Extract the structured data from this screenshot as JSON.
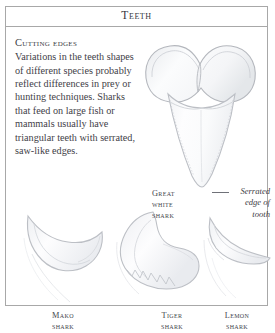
{
  "header": {
    "title": "Teeth"
  },
  "article": {
    "heading": "Cutting edges",
    "body": "Variations in the teeth shapes of different species probably reflect differences in prey or hunting techniques. Sharks that feed on large fish or mammals usually have triangular teeth with serrated, saw-like edges."
  },
  "annotation": {
    "line1": "Serrated",
    "line2": "edge of",
    "line3": "tooth"
  },
  "captions": {
    "great_white": {
      "line1": "Great",
      "line2": "white",
      "line3": "shark"
    },
    "mako": {
      "line1": "Mako",
      "line2": "shark"
    },
    "tiger": {
      "line1": "Tiger",
      "line2": "shark"
    },
    "lemon": {
      "line1": "Lemon",
      "line2": "shark"
    }
  },
  "illustrations": [
    {
      "name": "great-white-shark-tooth",
      "description": "Large broad triangular tooth with wide notched root, serrated edges"
    },
    {
      "name": "mako-shark-tooth",
      "description": "Narrow curved smooth-edged dagger tooth"
    },
    {
      "name": "tiger-shark-tooth",
      "description": "Hooked tooth with deeply serrated trailing edge"
    },
    {
      "name": "lemon-shark-tooth",
      "description": "Narrow triangular cusp on a broad flat root"
    }
  ],
  "colors": {
    "frame_border": "#a8a8a8",
    "text": "#3f4148",
    "heading": "#33353c",
    "illustration_outline": "#b9bcc2",
    "illustration_fill": "#fcfcfd",
    "page_background": "#ffffff"
  }
}
